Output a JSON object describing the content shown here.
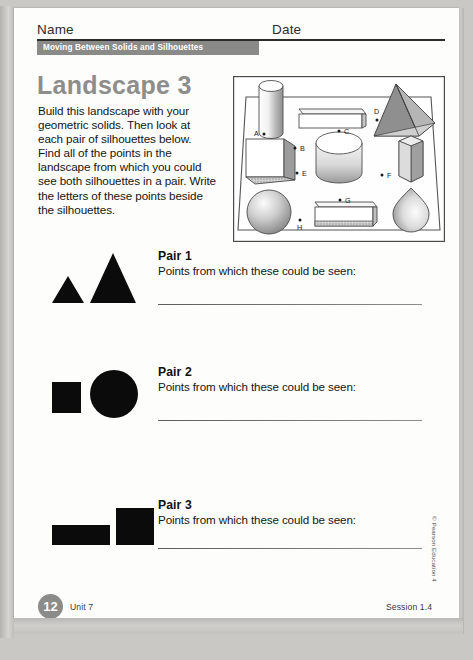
{
  "header": {
    "name_label": "Name",
    "date_label": "Date",
    "banner_label": "Moving Between Solids and Silhouettes"
  },
  "main": {
    "title": "Landscape 3",
    "intro": "Build this landscape with your geometric solids. Then look at each pair of silhouettes below. Find all of the points in the landscape from which you could see both silhouettes in a pair. Write the letters of these points beside the silhouettes."
  },
  "landscape": {
    "points": [
      {
        "label": "A",
        "label_x": 21,
        "label_y": 60,
        "dot_x": 31,
        "dot_y": 58
      },
      {
        "label": "B",
        "label_x": 70,
        "label_y": 75,
        "dot_x": 62,
        "dot_y": 72
      },
      {
        "label": "C",
        "label_x": 114,
        "label_y": 58,
        "dot_x": 106,
        "dot_y": 55
      },
      {
        "label": "D",
        "label_x": 143,
        "label_y": 35,
        "dot_x": 144,
        "dot_y": 44
      },
      {
        "label": "E",
        "label_x": 72,
        "label_y": 100,
        "dot_x": 64,
        "dot_y": 97
      },
      {
        "label": "F",
        "label_x": 157,
        "label_y": 102,
        "dot_x": 149,
        "dot_y": 99
      },
      {
        "label": "G",
        "label_x": 115,
        "label_y": 127,
        "dot_x": 107,
        "dot_y": 124
      },
      {
        "label": "H",
        "label_x": 66,
        "label_y": 153,
        "dot_x": 67,
        "dot_y": 144
      }
    ],
    "solids": [
      "cylinder-tall",
      "rectangular-prism-flat",
      "square-pyramid",
      "cube",
      "cylinder-wide",
      "hexagonal-prism",
      "sphere",
      "rectangular-prism-wide",
      "cone"
    ]
  },
  "pairs": [
    {
      "title": "Pair 1",
      "prompt": "Points from which these could be seen:",
      "answer": "",
      "shapes": [
        "triangle-small",
        "triangle-large"
      ]
    },
    {
      "title": "Pair 2",
      "prompt": "Points from which these could be seen:",
      "answer": "",
      "shapes": [
        "square-small",
        "circle-large"
      ]
    },
    {
      "title": "Pair 3",
      "prompt": "Points from which these could be seen:",
      "answer": "",
      "shapes": [
        "rectangle-wide",
        "square-tall"
      ]
    }
  ],
  "footer": {
    "page_number": "12",
    "unit": "Unit 7",
    "session": "Session 1.4",
    "copyright": "© Pearson Education 4"
  },
  "colors": {
    "banner_gray": "#8a8a88",
    "title_gray": "#8d8d8b",
    "silhouette_black": "#0b0b0b",
    "page_white": "#fdfdfc",
    "scan_background": "#c9c8c4"
  }
}
